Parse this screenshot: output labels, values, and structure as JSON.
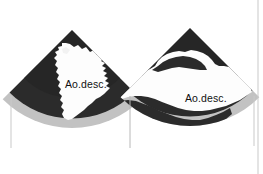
{
  "figure": {
    "kind": "ultrasound-sector-scan-pair",
    "modality": "2D B-mode echocardiography",
    "background_color": "#ffffff",
    "border_color": "#c9c9c9",
    "panel_count": 2
  },
  "palette": {
    "tissue_dark": "#2b2b2b",
    "tissue_dark_2": "#1f1f1f",
    "lumen_white": "#fdfdfd",
    "far_field_gray": "#b5b5b5",
    "far_field_gray_light": "#cfcfcf",
    "label_text": "#111111",
    "frame_line": "#bdbdbd",
    "center_line": "#b0b0b0"
  },
  "panels": [
    {
      "id": "left-panel",
      "name": "left-sector-scan",
      "label": "Ao.desc.",
      "label_x": 65,
      "label_y": 78,
      "apex_x": 72,
      "apex_y": 30,
      "sector_half_angle_deg": 45,
      "radius": 98,
      "has_far_field_band": true,
      "lumen_description": "vertically elongated irregular anechoic lumen at sector center"
    },
    {
      "id": "right-panel",
      "name": "right-sector-scan",
      "label": "Ao.desc.",
      "label_x": 185,
      "label_y": 92,
      "apex_x": 190,
      "apex_y": 28,
      "sector_half_angle_deg": 45,
      "radius": 98,
      "has_far_field_band": true,
      "lumen_description": "broad horizontally oriented anechoic lumen across mid and lower sector"
    }
  ],
  "annotations": [
    {
      "name": "label-left",
      "text": "Ao.desc.",
      "panel": "left-panel"
    },
    {
      "name": "label-right",
      "text": "Ao.desc.",
      "panel": "right-panel"
    }
  ],
  "frame": {
    "right_border_visible": true,
    "right_border_x": 258,
    "left_tick_visible": true,
    "left_tick_x": 11,
    "center_divider_visible": true,
    "center_divider_x": 130
  }
}
